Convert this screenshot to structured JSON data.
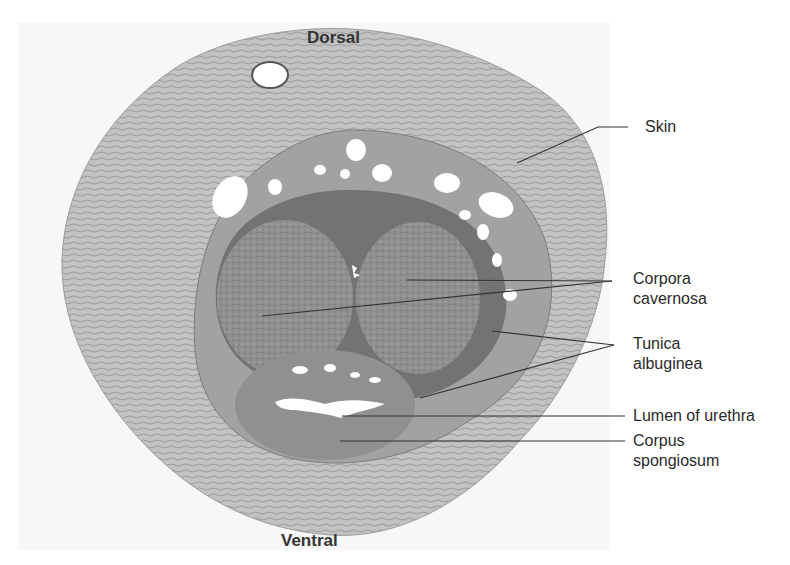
{
  "figure": {
    "orientation": {
      "top": "Dorsal",
      "bottom": "Ventral"
    },
    "labels": [
      {
        "id": "skin",
        "lines": [
          "Skin"
        ]
      },
      {
        "id": "corpora-cavernosa",
        "lines": [
          "Corpora",
          "cavernosa"
        ]
      },
      {
        "id": "tunica-albuginea",
        "lines": [
          "Tunica",
          "albuginea"
        ]
      },
      {
        "id": "lumen-of-urethra",
        "lines": [
          "Lumen of urethra"
        ]
      },
      {
        "id": "corpus-spongiosum",
        "lines": [
          "Corpus",
          "spongiosum"
        ]
      }
    ],
    "colors": {
      "background": "#ffffff",
      "tissue_outer": "#b9b9b9",
      "tissue_mid": "#8f8f8f",
      "tissue_dark": "#6e6e6e",
      "lumen": "#ffffff",
      "leader_line": "#333333",
      "text": "#2a2a2a"
    }
  }
}
